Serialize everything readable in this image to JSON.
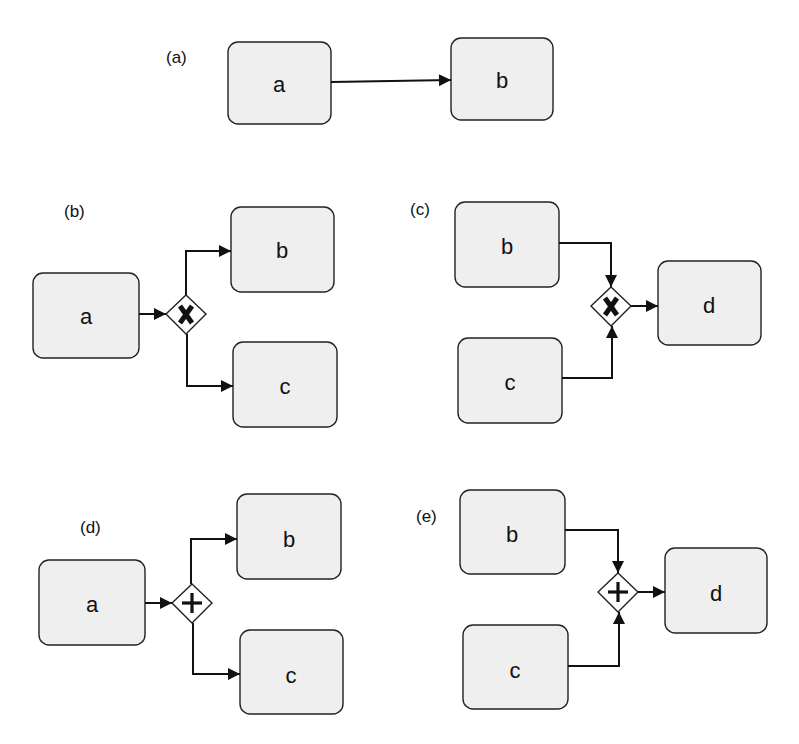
{
  "diagram": {
    "type": "BPMN gateway patterns",
    "panels": [
      {
        "id": "a",
        "label": "(a)",
        "pattern": "sequence",
        "tasks": [
          {
            "name": "a"
          },
          {
            "name": "b"
          }
        ],
        "flows": [
          [
            "a",
            "b"
          ]
        ]
      },
      {
        "id": "b",
        "label": "(b)",
        "pattern": "exclusive split (XOR)",
        "gateway": {
          "type": "exclusive",
          "symbol": "X"
        },
        "tasks": [
          {
            "name": "a"
          },
          {
            "name": "b"
          },
          {
            "name": "c"
          }
        ],
        "flows": [
          [
            "a",
            "gateway"
          ],
          [
            "gateway",
            "b"
          ],
          [
            "gateway",
            "c"
          ]
        ]
      },
      {
        "id": "c",
        "label": "(c)",
        "pattern": "exclusive join (XOR)",
        "gateway": {
          "type": "exclusive",
          "symbol": "X"
        },
        "tasks": [
          {
            "name": "b"
          },
          {
            "name": "c"
          },
          {
            "name": "d"
          }
        ],
        "flows": [
          [
            "b",
            "gateway"
          ],
          [
            "c",
            "gateway"
          ],
          [
            "gateway",
            "d"
          ]
        ]
      },
      {
        "id": "d",
        "label": "(d)",
        "pattern": "parallel split (AND)",
        "gateway": {
          "type": "parallel",
          "symbol": "+"
        },
        "tasks": [
          {
            "name": "a"
          },
          {
            "name": "b"
          },
          {
            "name": "c"
          }
        ],
        "flows": [
          [
            "a",
            "gateway"
          ],
          [
            "gateway",
            "b"
          ],
          [
            "gateway",
            "c"
          ]
        ]
      },
      {
        "id": "e",
        "label": "(e)",
        "pattern": "parallel join (AND)",
        "gateway": {
          "type": "parallel",
          "symbol": "+"
        },
        "tasks": [
          {
            "name": "b"
          },
          {
            "name": "c"
          },
          {
            "name": "d"
          }
        ],
        "flows": [
          [
            "b",
            "gateway"
          ],
          [
            "c",
            "gateway"
          ],
          [
            "gateway",
            "d"
          ]
        ]
      }
    ]
  }
}
